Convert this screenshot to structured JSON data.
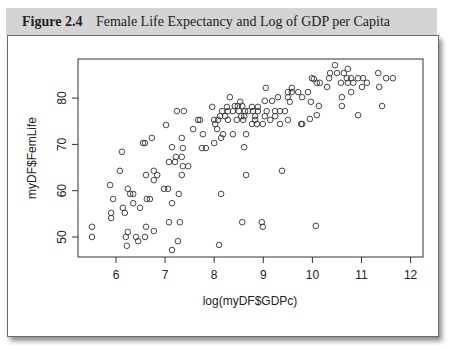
{
  "figure": {
    "number": "Figure 2.4",
    "title": "Female Life Expectancy and Log of GDP per Capita"
  },
  "colors": {
    "header_bg": "#d4d4d4",
    "point_stroke": "#333333",
    "axis": "#333333"
  },
  "chart_data": {
    "type": "scatter",
    "title": "Female Life Expectancy and Log of GDP per Capita",
    "xlabel": "log(myDF$GDPc)",
    "ylabel": "myDF$FemLife",
    "xlim": [
      5.25,
      12.2
    ],
    "ylim": [
      45.5,
      88.5
    ],
    "xticks": [
      6,
      7,
      8,
      9,
      10,
      11,
      12
    ],
    "yticks": [
      50,
      60,
      70,
      80
    ],
    "grid": false,
    "legend": null,
    "marker": "open-circle",
    "points": [
      [
        5.51,
        52.2
      ],
      [
        5.51,
        50.0
      ],
      [
        5.9,
        55.2
      ],
      [
        5.9,
        54.1
      ],
      [
        5.88,
        61.2
      ],
      [
        5.94,
        58.2
      ],
      [
        6.08,
        64.3
      ],
      [
        6.12,
        68.4
      ],
      [
        6.14,
        56.3
      ],
      [
        6.18,
        55.2
      ],
      [
        6.2,
        50.0
      ],
      [
        6.22,
        48.1
      ],
      [
        6.24,
        51.1
      ],
      [
        6.24,
        60.4
      ],
      [
        6.29,
        59.3
      ],
      [
        6.35,
        59.3
      ],
      [
        6.35,
        57.3
      ],
      [
        6.41,
        50.0
      ],
      [
        6.45,
        49.1
      ],
      [
        6.49,
        56.3
      ],
      [
        6.55,
        70.3
      ],
      [
        6.59,
        70.3
      ],
      [
        6.73,
        71.4
      ],
      [
        6.59,
        50.0
      ],
      [
        6.61,
        52.2
      ],
      [
        6.61,
        63.4
      ],
      [
        6.63,
        58.2
      ],
      [
        6.69,
        58.2
      ],
      [
        6.77,
        64.3
      ],
      [
        6.84,
        63.4
      ],
      [
        6.77,
        62.3
      ],
      [
        6.77,
        51.3
      ],
      [
        6.98,
        60.4
      ],
      [
        7.06,
        60.4
      ],
      [
        7.02,
        74.2
      ],
      [
        7.08,
        66.2
      ],
      [
        7.2,
        66.2
      ],
      [
        7.08,
        53.2
      ],
      [
        7.14,
        69.4
      ],
      [
        7.14,
        57.3
      ],
      [
        7.14,
        47.2
      ],
      [
        7.22,
        67.3
      ],
      [
        7.24,
        77.2
      ],
      [
        7.26,
        49.1
      ],
      [
        7.28,
        59.3
      ],
      [
        7.3,
        53.2
      ],
      [
        7.34,
        63.4
      ],
      [
        7.34,
        67.3
      ],
      [
        7.34,
        71.4
      ],
      [
        7.36,
        65.3
      ],
      [
        7.36,
        69.2
      ],
      [
        7.38,
        77.2
      ],
      [
        7.47,
        65.3
      ],
      [
        7.57,
        73.3
      ],
      [
        7.67,
        75.3
      ],
      [
        7.71,
        75.3
      ],
      [
        7.75,
        69.2
      ],
      [
        7.83,
        69.2
      ],
      [
        7.77,
        72.2
      ],
      [
        7.96,
        78.1
      ],
      [
        8.0,
        75.3
      ],
      [
        8.0,
        70.3
      ],
      [
        8.02,
        74.4
      ],
      [
        8.06,
        73.3
      ],
      [
        8.08,
        75.3
      ],
      [
        8.12,
        76.1
      ],
      [
        8.14,
        71.4
      ],
      [
        8.14,
        59.3
      ],
      [
        8.1,
        48.3
      ],
      [
        8.16,
        77.2
      ],
      [
        8.18,
        72.2
      ],
      [
        8.22,
        76.1
      ],
      [
        8.26,
        78.1
      ],
      [
        8.28,
        77.2
      ],
      [
        8.28,
        75.3
      ],
      [
        8.32,
        80.2
      ],
      [
        8.38,
        77.2
      ],
      [
        8.38,
        72.2
      ],
      [
        8.42,
        78.3
      ],
      [
        8.46,
        75.3
      ],
      [
        8.48,
        78.3
      ],
      [
        8.5,
        77.2
      ],
      [
        8.53,
        79.2
      ],
      [
        8.55,
        76.1
      ],
      [
        8.57,
        78.3
      ],
      [
        8.57,
        53.2
      ],
      [
        8.59,
        75.3
      ],
      [
        8.61,
        76.1
      ],
      [
        8.61,
        69.4
      ],
      [
        8.63,
        77.2
      ],
      [
        8.65,
        72.2
      ],
      [
        8.65,
        63.4
      ],
      [
        8.69,
        77.2
      ],
      [
        8.77,
        78.1
      ],
      [
        8.77,
        74.4
      ],
      [
        8.79,
        77.2
      ],
      [
        8.83,
        76.1
      ],
      [
        8.83,
        75.3
      ],
      [
        8.87,
        74.4
      ],
      [
        8.89,
        78.1
      ],
      [
        8.89,
        77.2
      ],
      [
        8.97,
        53.2
      ],
      [
        8.99,
        52.2
      ],
      [
        8.99,
        74.4
      ],
      [
        9.03,
        79.4
      ],
      [
        9.03,
        76.1
      ],
      [
        9.05,
        82.2
      ],
      [
        9.07,
        77.2
      ],
      [
        9.14,
        75.3
      ],
      [
        9.18,
        79.4
      ],
      [
        9.24,
        77.2
      ],
      [
        9.24,
        76.1
      ],
      [
        9.3,
        80.2
      ],
      [
        9.34,
        77.2
      ],
      [
        9.34,
        74.4
      ],
      [
        9.38,
        64.3
      ],
      [
        9.44,
        77.2
      ],
      [
        9.5,
        81.3
      ],
      [
        9.5,
        80.2
      ],
      [
        9.5,
        75.3
      ],
      [
        9.54,
        79.2
      ],
      [
        9.58,
        82.2
      ],
      [
        9.58,
        81.3
      ],
      [
        9.71,
        81.3
      ],
      [
        9.77,
        74.4
      ],
      [
        9.79,
        80.2
      ],
      [
        9.79,
        74.4
      ],
      [
        9.91,
        81.3
      ],
      [
        9.95,
        75.5
      ],
      [
        9.97,
        79.2
      ],
      [
        9.99,
        84.3
      ],
      [
        10.03,
        84.1
      ],
      [
        10.07,
        52.4
      ],
      [
        10.09,
        83.3
      ],
      [
        10.09,
        76.3
      ],
      [
        10.13,
        78.3
      ],
      [
        10.15,
        83.3
      ],
      [
        10.3,
        82.4
      ],
      [
        10.34,
        84.3
      ],
      [
        10.36,
        85.4
      ],
      [
        10.46,
        87.1
      ],
      [
        10.5,
        85.4
      ],
      [
        10.58,
        83.3
      ],
      [
        10.6,
        80.2
      ],
      [
        10.6,
        78.3
      ],
      [
        10.64,
        85.4
      ],
      [
        10.7,
        84.3
      ],
      [
        10.72,
        86.3
      ],
      [
        10.72,
        83.3
      ],
      [
        10.79,
        84.3
      ],
      [
        10.79,
        81.3
      ],
      [
        10.83,
        83.3
      ],
      [
        10.93,
        84.3
      ],
      [
        10.93,
        76.3
      ],
      [
        11.01,
        82.4
      ],
      [
        11.03,
        84.3
      ],
      [
        11.11,
        83.3
      ],
      [
        11.34,
        85.4
      ],
      [
        11.36,
        82.4
      ],
      [
        11.42,
        78.3
      ],
      [
        11.5,
        84.3
      ],
      [
        11.64,
        84.3
      ]
    ]
  }
}
